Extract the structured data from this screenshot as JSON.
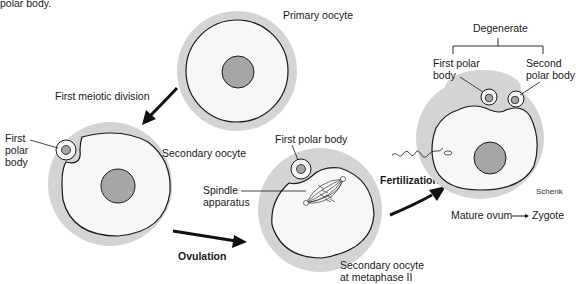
{
  "caption_fragment": "polar body.",
  "cells": {
    "primary": {
      "label": "Primary oocyte"
    },
    "secondary": {
      "label": "Secondary oocyte",
      "polar_label_1": "First",
      "polar_label_2": "polar",
      "polar_label_3": "body"
    },
    "metaphase": {
      "label_1": "Secondary oocyte",
      "label_2": "at metaphase II",
      "polar_label": "First polar body",
      "spindle_label_1": "Spindle",
      "spindle_label_2": "apparatus"
    },
    "zygote": {
      "degenerate": "Degenerate",
      "first_polar_1": "First polar",
      "first_polar_2": "body",
      "second_polar_1": "Second",
      "second_polar_2": "polar body",
      "signature": "Schenk"
    }
  },
  "arrows": {
    "meiotic": "First meiotic division",
    "ovulation": "Ovulation",
    "fertilization": "Fertilization"
  },
  "bottom": {
    "mature": "Mature ovum",
    "zygote": "Zygote"
  },
  "colors": {
    "zona": "#d4d4d4",
    "cytoplasm": "#f7f7f7",
    "nucleus": "#a6a6a6",
    "outline": "#1a1a1a"
  }
}
